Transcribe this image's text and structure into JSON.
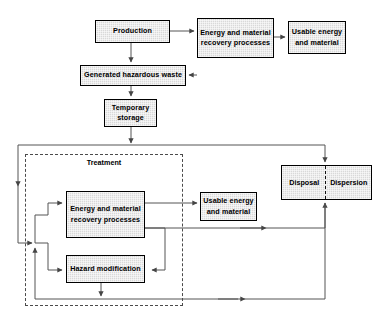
{
  "diagram": {
    "type": "flowchart",
    "palette": {
      "node_fill": "#d9d9d9",
      "node_border": "#000000",
      "connector": "#555555",
      "dashed_group": "#4a4a4a",
      "background": "#ffffff"
    },
    "nodes": [
      {
        "id": "production",
        "label": "Production",
        "lines": [
          "Production"
        ],
        "x": 95,
        "y": 20,
        "w": 75,
        "h": 23
      },
      {
        "id": "recovery-top",
        "label": "Energy and material recovery processes",
        "lines": [
          "Energy and material",
          "recovery processes"
        ],
        "x": 197,
        "y": 18,
        "w": 77,
        "h": 40
      },
      {
        "id": "usable-top",
        "label": "Usable energy and material",
        "lines": [
          "Usable energy",
          "and material"
        ],
        "x": 288,
        "y": 21,
        "w": 58,
        "h": 33
      },
      {
        "id": "generated-waste",
        "label": "Generated hazardous waste",
        "lines": [
          "Generated hazardous waste"
        ],
        "x": 80,
        "y": 65,
        "w": 106,
        "h": 21
      },
      {
        "id": "temporary-storage",
        "label": "Temporary storage",
        "lines": [
          "Temporary",
          "storage"
        ],
        "x": 104,
        "y": 99,
        "w": 53,
        "h": 28
      },
      {
        "id": "recovery-treatment",
        "label": "Energy and material recovery processes",
        "lines": [
          "Energy and material",
          "recovery processes"
        ],
        "x": 66,
        "y": 191,
        "w": 79,
        "h": 47
      },
      {
        "id": "hazard-modification",
        "label": "Hazard modification",
        "lines": [
          "Hazard modification"
        ],
        "x": 66,
        "y": 255,
        "w": 79,
        "h": 28
      },
      {
        "id": "usable-treatment",
        "label": "Usable energy and material",
        "lines": [
          "Usable energy",
          "and material"
        ],
        "x": 200,
        "y": 192,
        "w": 57,
        "h": 29
      }
    ],
    "split_node": {
      "id": "disposal-dispersion",
      "left_label": "Disposal",
      "right_label": "Dispersion",
      "x": 281,
      "y": 165,
      "w": 91,
      "h": 35,
      "divider_x": 325
    },
    "groups": [
      {
        "id": "outer-system-boundary",
        "kind": "solid",
        "x": 18,
        "y": 145,
        "w": 307,
        "h": 160
      },
      {
        "id": "treatment-boundary",
        "kind": "dashed",
        "label": "Treatment",
        "x": 25,
        "y": 154,
        "w": 158,
        "h": 152,
        "label_x": 25,
        "label_y": 158,
        "label_w": 158
      }
    ],
    "connectors": [
      {
        "id": "production-to-recovery-top",
        "from": "production",
        "to": "recovery-top"
      },
      {
        "id": "recovery-top-to-usable-top",
        "from": "recovery-top",
        "to": "usable-top"
      },
      {
        "id": "production-to-generated-waste",
        "from": "production",
        "to": "generated-waste"
      },
      {
        "id": "recovery-top-to-generated-waste",
        "from": "recovery-top",
        "to": "generated-waste"
      },
      {
        "id": "generated-waste-to-temporary-storage",
        "from": "generated-waste",
        "to": "temporary-storage"
      },
      {
        "id": "temporary-storage-to-treatment",
        "from": "temporary-storage",
        "to": "outer-system-boundary"
      },
      {
        "id": "boundary-to-recovery-treatment",
        "from": "outer-system-boundary",
        "to": "recovery-treatment"
      },
      {
        "id": "boundary-to-hazard-modification",
        "from": "outer-system-boundary",
        "to": "hazard-modification"
      },
      {
        "id": "recovery-treatment-to-usable-treatment",
        "from": "recovery-treatment",
        "to": "usable-treatment"
      },
      {
        "id": "recovery-treatment-to-hazard-modification",
        "from": "recovery-treatment",
        "to": "hazard-modification"
      },
      {
        "id": "recovery-treatment-to-disposal",
        "from": "recovery-treatment",
        "to": "disposal-dispersion"
      },
      {
        "id": "hazard-modification-to-disposal",
        "from": "hazard-modification",
        "to": "disposal-dispersion"
      },
      {
        "id": "boundary-return-to-recovery",
        "from": "outer-system-boundary",
        "to": "recovery-treatment"
      }
    ]
  }
}
